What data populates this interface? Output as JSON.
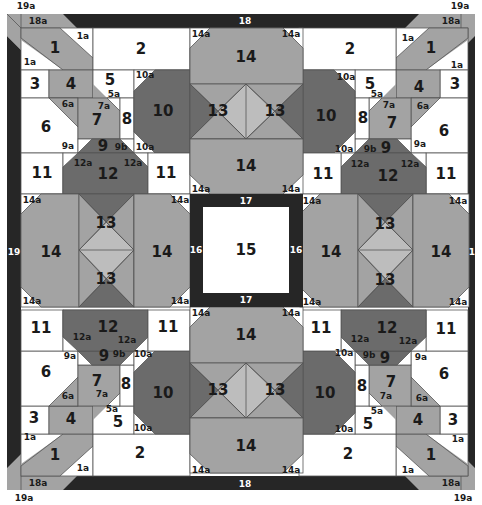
{
  "diagram": {
    "colors": {
      "white": "#ffffff",
      "light_gray": "#a3a3a3",
      "medium_gray": "#8c8c8c",
      "dark_gray": "#6b6b6b",
      "pale_gray": "#bdbdbd",
      "border_black": "#262626",
      "line": "#555555"
    },
    "border_labels": {
      "top": "18",
      "bottom": "18",
      "left": "19",
      "right": "19",
      "corner_18a": "18a",
      "corner_19a": "19a"
    },
    "center": {
      "square": "15",
      "frame_top": "17",
      "frame_bottom": "17",
      "frame_left": "16",
      "frame_right": "16"
    },
    "piece_labels": {
      "p1": "1",
      "p1a": "1a",
      "p2": "2",
      "p3": "3",
      "p4": "4",
      "p5": "5",
      "p5a": "5a",
      "p6": "6",
      "p6a": "6a",
      "p7": "7",
      "p7a": "7a",
      "p8": "8",
      "p9": "9",
      "p9a": "9a",
      "p9b": "9b",
      "p10": "10",
      "p10a": "10a",
      "p11": "11",
      "p12": "12",
      "p12a": "12a",
      "p13": "13",
      "p14": "14",
      "p14a": "14a"
    }
  }
}
